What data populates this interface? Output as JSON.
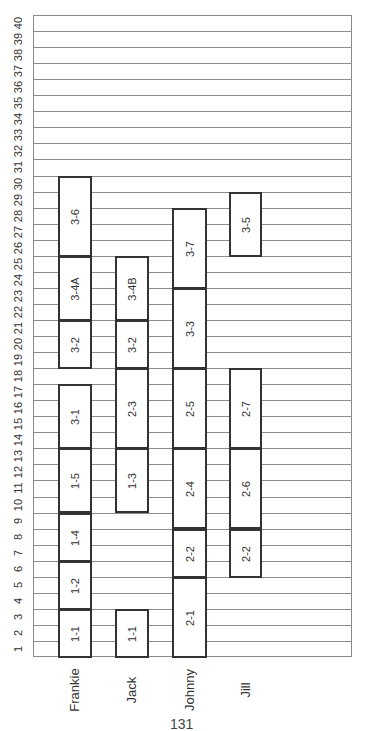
{
  "chart_data": {
    "type": "bar",
    "subtype": "gantt",
    "orientation": "rotated (page rotated 90deg counter-clockwise)",
    "title": "",
    "xlabel": "",
    "ylabel": "",
    "axis_ticks": [
      1,
      2,
      3,
      4,
      5,
      6,
      7,
      8,
      9,
      10,
      11,
      12,
      13,
      14,
      15,
      16,
      17,
      18,
      19,
      20,
      21,
      22,
      23,
      24,
      25,
      26,
      27,
      28,
      29,
      30,
      31,
      32,
      33,
      34,
      35,
      36,
      37,
      38,
      39,
      40
    ],
    "axis_range": [
      0,
      40
    ],
    "grid": true,
    "categories": [
      "Frankie",
      "Jack",
      "Johnny",
      "Jill"
    ],
    "series": [
      {
        "name": "Frankie",
        "tasks": [
          {
            "label": "1-1",
            "start": 0,
            "end": 3
          },
          {
            "label": "1-2",
            "start": 3,
            "end": 6
          },
          {
            "label": "1-4",
            "start": 6,
            "end": 9
          },
          {
            "label": "1-5",
            "start": 9,
            "end": 13
          },
          {
            "label": "3-1",
            "start": 13,
            "end": 17
          },
          {
            "label": "3-2",
            "start": 18,
            "end": 21
          },
          {
            "label": "3-4A",
            "start": 21,
            "end": 25
          },
          {
            "label": "3-6",
            "start": 25,
            "end": 30
          }
        ]
      },
      {
        "name": "Jack",
        "tasks": [
          {
            "label": "1-1",
            "start": 0,
            "end": 3
          },
          {
            "label": "1-3",
            "start": 9,
            "end": 13
          },
          {
            "label": "2-3",
            "start": 13,
            "end": 18
          },
          {
            "label": "3-2",
            "start": 18,
            "end": 21
          },
          {
            "label": "3-4B",
            "start": 21,
            "end": 25
          }
        ]
      },
      {
        "name": "Johnny",
        "tasks": [
          {
            "label": "2-1",
            "start": 0,
            "end": 5
          },
          {
            "label": "2-2",
            "start": 5,
            "end": 8
          },
          {
            "label": "2-4",
            "start": 8,
            "end": 13
          },
          {
            "label": "2-5",
            "start": 13,
            "end": 18
          },
          {
            "label": "3-3",
            "start": 18,
            "end": 23
          },
          {
            "label": "3-7",
            "start": 23,
            "end": 28
          }
        ]
      },
      {
        "name": "Jill",
        "tasks": [
          {
            "label": "2-2",
            "start": 5,
            "end": 8
          },
          {
            "label": "2-6",
            "start": 8,
            "end": 13
          },
          {
            "label": "2-7",
            "start": 13,
            "end": 18
          },
          {
            "label": "3-5",
            "start": 25,
            "end": 29
          }
        ]
      }
    ]
  },
  "page_number": "131"
}
